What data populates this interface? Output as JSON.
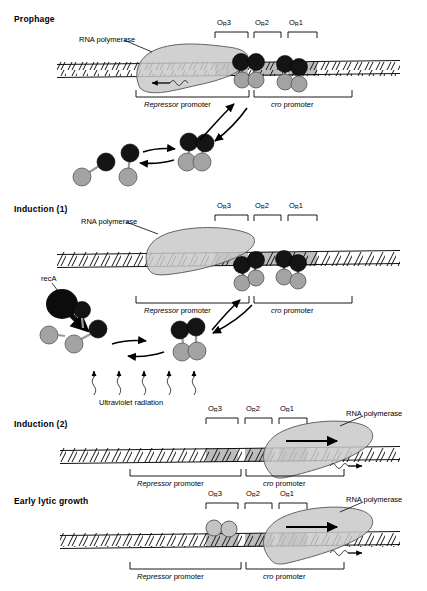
{
  "figure": {
    "title_visible": false,
    "colors": {
      "polymerase_fill": "#c9c9c9",
      "polymerase_stroke": "#4a4a4a",
      "repressor_dna_domain": "#6e6e6e",
      "repressor_black": "#151515",
      "cro_light": "#b5b5b5",
      "operator_shade": "#b8b8b8",
      "dna_line": "#111111",
      "text": "#000000"
    }
  },
  "panels": [
    {
      "id": "prophage",
      "title": "Prophage",
      "operators": [
        {
          "label_o": "O",
          "label_sub": "R",
          "label_num": "3",
          "full": "OR3"
        },
        {
          "label_o": "O",
          "label_sub": "R",
          "label_num": "2",
          "full": "OR2"
        },
        {
          "label_o": "O",
          "label_sub": "R",
          "label_num": "1",
          "full": "OR1"
        }
      ],
      "annotations": {
        "polymerase_label": "RNA polymerase",
        "repressor_promoter": {
          "italic": "Repressor",
          "plain": " promoter"
        },
        "cro_promoter": {
          "italic": "cro",
          "plain": " promoter"
        }
      },
      "bound_proteins": [
        {
          "type": "repressor-dimer",
          "at": "OR2"
        },
        {
          "type": "repressor-dimer",
          "at": "OR1"
        }
      ],
      "polymerase": {
        "bound_at": "Repressor promoter",
        "transcript_direction": "left"
      },
      "equilibrium": {
        "left": "2 repressor monomers",
        "right": "repressor dimer",
        "arrows": "double"
      }
    },
    {
      "id": "induction-1",
      "title": "Induction (1)",
      "operators": [
        {
          "label_o": "O",
          "label_sub": "R",
          "label_num": "3",
          "full": "OR3"
        },
        {
          "label_o": "O",
          "label_sub": "R",
          "label_num": "2",
          "full": "OR2"
        },
        {
          "label_o": "O",
          "label_sub": "R",
          "label_num": "1",
          "full": "OR1"
        }
      ],
      "annotations": {
        "polymerase_label": "RNA polymerase",
        "reca_label": "recA",
        "uv_label": "Ultraviolet radiation",
        "repressor_promoter": {
          "italic": "Repressor",
          "plain": " promoter"
        },
        "cro_promoter": {
          "italic": "cro",
          "plain": " promoter"
        }
      },
      "bound_proteins": [
        {
          "type": "repressor-dimer",
          "at": "OR2"
        },
        {
          "type": "repressor-dimer",
          "at": "OR1"
        }
      ],
      "polymerase": {
        "bound_at": "Repressor promoter",
        "transcript_direction": "none"
      },
      "uv_arrow_count": 5
    },
    {
      "id": "induction-2",
      "title": "Induction (2)",
      "operators": [
        {
          "label_o": "O",
          "label_sub": "R",
          "label_num": "3",
          "full": "OR3"
        },
        {
          "label_o": "O",
          "label_sub": "R",
          "label_num": "2",
          "full": "OR2"
        },
        {
          "label_o": "O",
          "label_sub": "R",
          "label_num": "1",
          "full": "OR1"
        }
      ],
      "annotations": {
        "polymerase_label": "RNA polymerase",
        "repressor_promoter": {
          "italic": "Repressor",
          "plain": " promoter"
        },
        "cro_promoter": {
          "italic": "cro",
          "plain": " promoter"
        }
      },
      "bound_proteins": [],
      "polymerase": {
        "bound_at": "cro promoter",
        "transcript_direction": "right"
      }
    },
    {
      "id": "early-lytic-growth",
      "title": "Early lytic growth",
      "operators": [
        {
          "label_o": "O",
          "label_sub": "R",
          "label_num": "3",
          "full": "OR3"
        },
        {
          "label_o": "O",
          "label_sub": "R",
          "label_num": "2",
          "full": "OR2"
        },
        {
          "label_o": "O",
          "label_sub": "R",
          "label_num": "1",
          "full": "OR1"
        }
      ],
      "annotations": {
        "polymerase_label": "RNA polymerase",
        "repressor_promoter": {
          "italic": "Repressor",
          "plain": " promoter"
        },
        "cro_promoter": {
          "italic": "cro",
          "plain": " promoter"
        }
      },
      "bound_proteins": [
        {
          "type": "cro-dimer",
          "at": "OR3"
        }
      ],
      "polymerase": {
        "bound_at": "cro promoter",
        "transcript_direction": "right"
      }
    }
  ]
}
